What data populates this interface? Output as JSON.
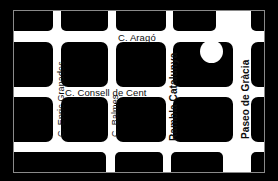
{
  "map": {
    "title": "Barcelona Eixample street grid map",
    "background_color": "#000000",
    "street_color": "#ffffff",
    "block_color": "#000000",
    "frame_color": "#8a8a8a",
    "label_color": "#0d0d0d",
    "streets": {
      "horizontal": [
        {
          "id": "arago",
          "name": "C. Aragó",
          "emphasis": "minor"
        },
        {
          "id": "consell-de-cent",
          "name": "C. Consell de Cent",
          "emphasis": "minor"
        }
      ],
      "vertical": [
        {
          "id": "enric-granados",
          "name": "C. Enric Granados",
          "emphasis": "minor"
        },
        {
          "id": "balmes",
          "name": "C. Balmes",
          "emphasis": "minor"
        },
        {
          "id": "rambla-catalunya",
          "name": "Rambla Catalunya",
          "emphasis": "major"
        },
        {
          "id": "paseo-de-gracia",
          "name": "Paseo de Gràcia",
          "emphasis": "major"
        }
      ]
    },
    "landmark": {
      "id": "placa-marker",
      "shape": "circle",
      "fill": "#ffffff",
      "diameter_px": 23
    }
  }
}
